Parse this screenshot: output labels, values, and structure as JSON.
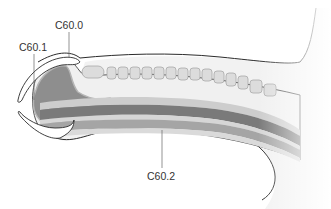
{
  "labels": [
    {
      "id": "c60_0",
      "text": "C60.0",
      "x": 55,
      "y": 20,
      "leader_x": 69,
      "leader_y1": 32,
      "leader_y2": 57
    },
    {
      "id": "c60_1",
      "text": "C60.1",
      "x": 19,
      "y": 42,
      "leader_x": 34,
      "leader_y1": 54,
      "leader_y2": 100
    },
    {
      "id": "c60_2",
      "text": "C60.2",
      "x": 147,
      "y": 172,
      "leader_x": 162,
      "leader_y1": 130,
      "leader_y2": 168
    }
  ],
  "colors": {
    "outline": "#2b2b2b",
    "skin_fill": "#f0f0f0",
    "glans_dark": "#8e8e8e",
    "band_dark": "#7a7a7a",
    "band_mid": "#a5a5a5",
    "band_light": "#cdcdcd",
    "tooth_fill": "#dcdcdc",
    "tooth_stroke": "#a8a8a8",
    "leader": "#666666",
    "text": "#333333"
  }
}
